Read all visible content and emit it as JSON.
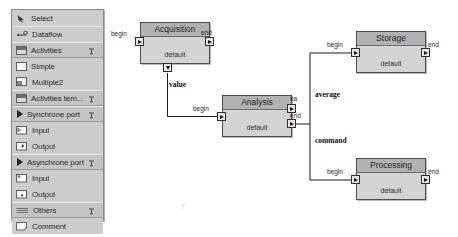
{
  "palette": {
    "items": [
      {
        "label": "Select",
        "icon": "cursor-icon",
        "kind": "tool",
        "pinned": false
      },
      {
        "label": "Dataflow",
        "icon": "dataflow-icon",
        "kind": "tool",
        "pinned": false
      },
      {
        "label": "Activities",
        "icon": "folder-tab-icon",
        "kind": "category",
        "pinned": true
      },
      {
        "label": "Simple",
        "icon": "simple-box-icon",
        "kind": "entry",
        "pinned": false
      },
      {
        "label": "Multiple2",
        "icon": "multiple-box-icon",
        "kind": "entry",
        "pinned": false
      },
      {
        "label": "Activities tem...",
        "icon": "folder-tab-icon",
        "kind": "category",
        "pinned": true
      },
      {
        "label": "Synchrone port",
        "icon": "triangle-icon",
        "kind": "category",
        "pinned": true
      },
      {
        "label": "Input",
        "icon": "sync-input-icon",
        "kind": "entry",
        "pinned": false
      },
      {
        "label": "Output",
        "icon": "sync-output-icon",
        "kind": "entry",
        "pinned": false
      },
      {
        "label": "Asynchrone port",
        "icon": "triangle-icon",
        "kind": "category",
        "pinned": true
      },
      {
        "label": "Input",
        "icon": "async-input-icon",
        "kind": "entry",
        "pinned": false
      },
      {
        "label": "Output",
        "icon": "async-output-icon",
        "kind": "entry",
        "pinned": false
      },
      {
        "label": "Others",
        "icon": "others-icon",
        "kind": "category",
        "pinned": true
      },
      {
        "label": "Comment",
        "icon": "comment-icon",
        "kind": "entry",
        "pinned": false
      }
    ]
  },
  "diagram": {
    "nodes": [
      {
        "id": "acquisition",
        "title": "Acquisition",
        "default_label": "default"
      },
      {
        "id": "analysis",
        "title": "Analysis",
        "default_label": "default"
      },
      {
        "id": "storage",
        "title": "Storage",
        "default_label": "default"
      },
      {
        "id": "processing",
        "title": "Processing",
        "default_label": "default"
      }
    ],
    "port_labels": {
      "acquisition_begin": "begin",
      "acquisition_end": "end",
      "analysis_begin": "begin",
      "analysis_na": "na",
      "analysis_end": "end",
      "storage_begin": "begin",
      "storage_end": "end",
      "processing_begin": "begin",
      "processing_end": "end"
    },
    "edge_labels": {
      "value": "value",
      "average": "average",
      "command": "command"
    },
    "artifact_glyph": "T"
  },
  "colors": {
    "palette_bg": "#c9c9c9",
    "node_body": "#d4d4d4",
    "node_title": "#b2b2b2",
    "node_border": "#4d4d4d",
    "edge": "#1a1a1a"
  }
}
